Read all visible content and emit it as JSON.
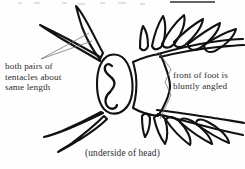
{
  "figure": {
    "caption": "(underside of head)",
    "annotations": [
      {
        "id": "left",
        "text": "both pairs of\ntentacles about\nsame length",
        "points_to": "tentacles"
      },
      {
        "id": "right",
        "text": "front of foot is\nbluntly angled",
        "points_to": "foot-front-edge"
      }
    ],
    "colors": {
      "ink": "#111111",
      "text": "#2e2e2e",
      "leader": "#707070",
      "background": "#fefefe"
    },
    "parts": [
      "upper-left-tentacle-pair",
      "lower-left-tentacle-pair",
      "head",
      "foot",
      "upper-right-lobes",
      "lower-right-lobes"
    ]
  },
  "top_crop": {
    "note": "cropped text line remnant with underline"
  }
}
